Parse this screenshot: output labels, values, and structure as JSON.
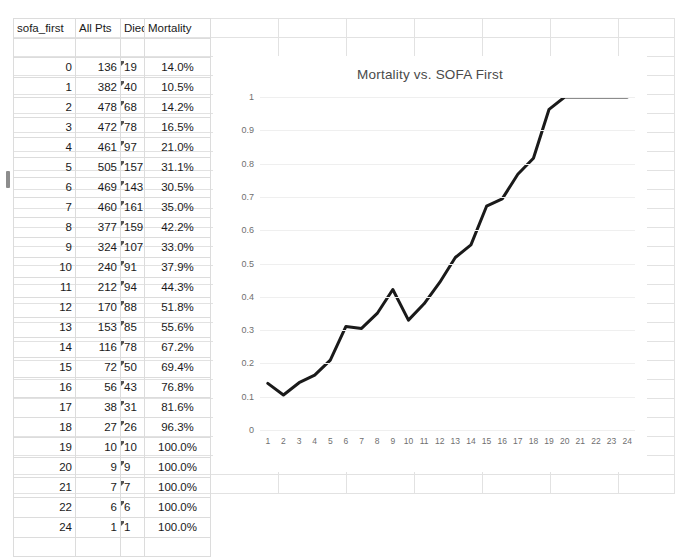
{
  "table": {
    "headers": [
      "sofa_first",
      "All Pts",
      "Died",
      "Mortality"
    ],
    "rows": [
      {
        "sofa_first": "0",
        "all_pts": "136",
        "died": "19",
        "mortality": "14.0%"
      },
      {
        "sofa_first": "1",
        "all_pts": "382",
        "died": "40",
        "mortality": "10.5%"
      },
      {
        "sofa_first": "2",
        "all_pts": "478",
        "died": "68",
        "mortality": "14.2%"
      },
      {
        "sofa_first": "3",
        "all_pts": "472",
        "died": "78",
        "mortality": "16.5%"
      },
      {
        "sofa_first": "4",
        "all_pts": "461",
        "died": "97",
        "mortality": "21.0%"
      },
      {
        "sofa_first": "5",
        "all_pts": "505",
        "died": "157",
        "mortality": "31.1%"
      },
      {
        "sofa_first": "6",
        "all_pts": "469",
        "died": "143",
        "mortality": "30.5%"
      },
      {
        "sofa_first": "7",
        "all_pts": "460",
        "died": "161",
        "mortality": "35.0%"
      },
      {
        "sofa_first": "8",
        "all_pts": "377",
        "died": "159",
        "mortality": "42.2%"
      },
      {
        "sofa_first": "9",
        "all_pts": "324",
        "died": "107",
        "mortality": "33.0%"
      },
      {
        "sofa_first": "10",
        "all_pts": "240",
        "died": "91",
        "mortality": "37.9%"
      },
      {
        "sofa_first": "11",
        "all_pts": "212",
        "died": "94",
        "mortality": "44.3%"
      },
      {
        "sofa_first": "12",
        "all_pts": "170",
        "died": "88",
        "mortality": "51.8%"
      },
      {
        "sofa_first": "13",
        "all_pts": "153",
        "died": "85",
        "mortality": "55.6%"
      },
      {
        "sofa_first": "14",
        "all_pts": "116",
        "died": "78",
        "mortality": "67.2%"
      },
      {
        "sofa_first": "15",
        "all_pts": "72",
        "died": "50",
        "mortality": "69.4%"
      },
      {
        "sofa_first": "16",
        "all_pts": "56",
        "died": "43",
        "mortality": "76.8%"
      },
      {
        "sofa_first": "17",
        "all_pts": "38",
        "died": "31",
        "mortality": "81.6%"
      },
      {
        "sofa_first": "18",
        "all_pts": "27",
        "died": "26",
        "mortality": "96.3%"
      },
      {
        "sofa_first": "19",
        "all_pts": "10",
        "died": "10",
        "mortality": "100.0%"
      },
      {
        "sofa_first": "20",
        "all_pts": "9",
        "died": "9",
        "mortality": "100.0%"
      },
      {
        "sofa_first": "21",
        "all_pts": "7",
        "died": "7",
        "mortality": "100.0%"
      },
      {
        "sofa_first": "22",
        "all_pts": "6",
        "died": "6",
        "mortality": "100.0%"
      },
      {
        "sofa_first": "24",
        "all_pts": "1",
        "died": "1",
        "mortality": "100.0%"
      }
    ],
    "selected_row_index": 6
  },
  "chart_data": {
    "type": "line",
    "title": "Mortality vs. SOFA First",
    "xlabel": "",
    "ylabel": "",
    "ylim": [
      0,
      1
    ],
    "yticks": [
      "0",
      "0.1",
      "0.2",
      "0.3",
      "0.4",
      "0.5",
      "0.6",
      "0.7",
      "0.8",
      "0.9",
      "1"
    ],
    "categories": [
      "1",
      "2",
      "3",
      "4",
      "5",
      "6",
      "7",
      "8",
      "9",
      "10",
      "11",
      "12",
      "13",
      "14",
      "15",
      "16",
      "17",
      "18",
      "19",
      "20",
      "21",
      "22",
      "23",
      "24"
    ],
    "values": [
      0.14,
      0.105,
      0.142,
      0.165,
      0.21,
      0.311,
      0.305,
      0.35,
      0.422,
      0.33,
      0.379,
      0.443,
      0.518,
      0.556,
      0.672,
      0.694,
      0.768,
      0.816,
      0.963,
      1.0,
      1.0,
      1.0,
      1.0,
      1.0
    ],
    "grid": true,
    "legend": false,
    "line_color": "#1a1a1a",
    "line_width": 3
  },
  "colors": {
    "grid_line": "#e2e2e2",
    "chart_grid": "#efefef",
    "text": "#1a1a1a",
    "axis_text": "#6f6f6f",
    "title_text": "#4a4a4a"
  }
}
